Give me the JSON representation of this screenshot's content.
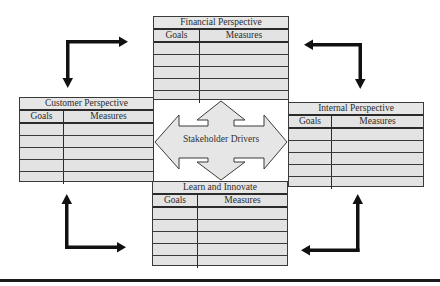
{
  "diagram": {
    "center_label": "Stakeholder Drivers",
    "tables": {
      "financial": {
        "title": "Financial Perspective",
        "col_goals": "Goals",
        "col_measures": "Measures",
        "rows": 5
      },
      "customer": {
        "title": "Customer Perspective",
        "col_goals": "Goals",
        "col_measures": "Measures",
        "rows": 5
      },
      "internal": {
        "title": "Internal Perspective",
        "col_goals": "Goals",
        "col_measures": "Measures",
        "rows": 5
      },
      "learn": {
        "title": "Learn and Innovate",
        "col_goals": "Goals",
        "col_measures": "Measures",
        "rows": 5
      }
    },
    "corner_arrows": [
      {
        "position": "top-left",
        "direction": "clockwise"
      },
      {
        "position": "top-right",
        "direction": "clockwise"
      },
      {
        "position": "bottom-right",
        "direction": "clockwise"
      },
      {
        "position": "bottom-left",
        "direction": "clockwise"
      }
    ],
    "colors": {
      "cell_fill": "#e3e3e3",
      "border": "#2a2a2a",
      "arrow_fill": "#e6e6e6",
      "corner_arrow": "#111111"
    }
  }
}
